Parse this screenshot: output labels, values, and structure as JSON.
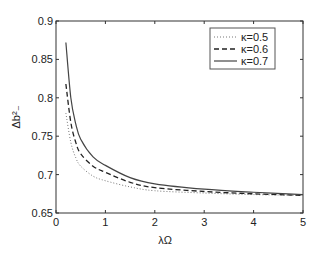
{
  "chart_data": {
    "type": "line",
    "title": "",
    "xlabel": "λΩ",
    "ylabel": "Δb²₋",
    "xlim": [
      0,
      5
    ],
    "ylim": [
      0.65,
      0.9
    ],
    "xticks": [
      "0",
      "1",
      "2",
      "3",
      "4",
      "5"
    ],
    "yticks": [
      "0.65",
      "0.7",
      "0.75",
      "0.8",
      "0.85",
      "0.9"
    ],
    "grid": false,
    "legend_position": "upper right",
    "x": [
      0.2,
      0.3,
      0.4,
      0.5,
      0.75,
      1,
      1.5,
      2,
      3,
      4,
      5
    ],
    "series": [
      {
        "name": "κ=0.5",
        "style": "dotted",
        "values": [
          0.78,
          0.742,
          0.722,
          0.711,
          0.698,
          0.692,
          0.684,
          0.679,
          0.676,
          0.674,
          0.673
        ]
      },
      {
        "name": "κ=0.6",
        "style": "dashed",
        "values": [
          0.818,
          0.768,
          0.742,
          0.727,
          0.711,
          0.703,
          0.69,
          0.683,
          0.678,
          0.675,
          0.673
        ]
      },
      {
        "name": "κ=0.7",
        "style": "solid",
        "values": [
          0.872,
          0.8,
          0.766,
          0.746,
          0.723,
          0.712,
          0.696,
          0.688,
          0.681,
          0.677,
          0.674
        ]
      }
    ]
  }
}
